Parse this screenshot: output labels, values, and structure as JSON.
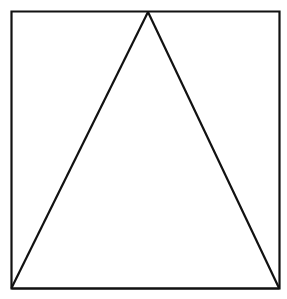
{
  "diagram": {
    "shapes": [
      {
        "name": "square",
        "kind": "square"
      },
      {
        "name": "triangle",
        "kind": "isosceles-triangle",
        "apex": "top-edge-midpoint",
        "base": "bottom-edge"
      }
    ],
    "colors": {
      "stroke": "#111111",
      "background": "#ffffff"
    }
  }
}
